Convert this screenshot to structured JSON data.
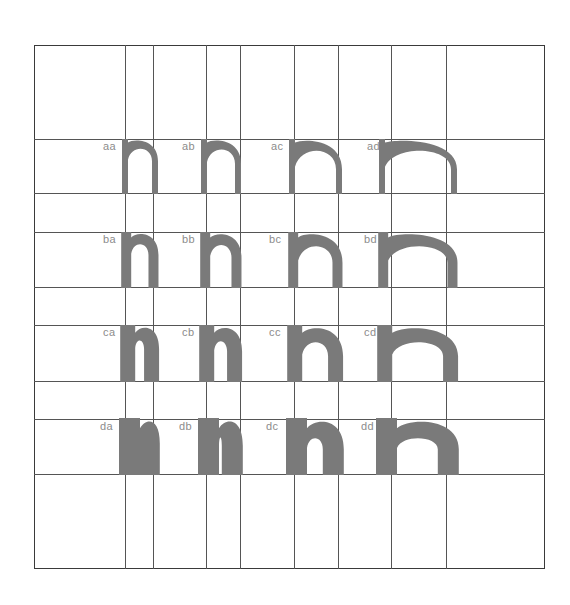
{
  "figure": {
    "title": "",
    "colors": {
      "background": "#ffffff",
      "glyph": "#7a7a7a",
      "label": "#8c8c8c",
      "grid": "#555555",
      "border": "#3a3a3a"
    },
    "frame": {
      "left": 34,
      "top": 45,
      "right": 545,
      "bottom": 569
    },
    "vertical_lines_x": [
      125,
      153,
      206,
      240,
      294,
      338,
      391,
      446
    ],
    "horizontal_lines_y": [
      139,
      193,
      232,
      287,
      325,
      381,
      419,
      474
    ],
    "rows": [
      {
        "id": "a",
        "top": 139,
        "bottom": 194,
        "stem": 6,
        "arch": 6
      },
      {
        "id": "b",
        "top": 232,
        "bottom": 288,
        "stem": 10,
        "arch": 9
      },
      {
        "id": "c",
        "top": 325,
        "bottom": 382,
        "stem": 15,
        "arch": 13
      },
      {
        "id": "d",
        "top": 418,
        "bottom": 475,
        "stem": 21,
        "arch": 17
      }
    ],
    "columns": [
      {
        "id": "a",
        "left": 122,
        "right": 158
      },
      {
        "id": "b",
        "left": 201,
        "right": 241
      },
      {
        "id": "c",
        "left": 289,
        "right": 342
      },
      {
        "id": "d",
        "left": 379,
        "right": 457
      }
    ],
    "cells": [
      {
        "label": "aa",
        "row": 0,
        "col": 0,
        "label_x": 103,
        "label_y": 141
      },
      {
        "label": "ab",
        "row": 0,
        "col": 1,
        "label_x": 182,
        "label_y": 141
      },
      {
        "label": "ac",
        "row": 0,
        "col": 2,
        "label_x": 271,
        "label_y": 141
      },
      {
        "label": "ad",
        "row": 0,
        "col": 3,
        "label_x": 367,
        "label_y": 141
      },
      {
        "label": "ba",
        "row": 1,
        "col": 0,
        "label_x": 103,
        "label_y": 234
      },
      {
        "label": "bb",
        "row": 1,
        "col": 1,
        "label_x": 182,
        "label_y": 234
      },
      {
        "label": "bc",
        "row": 1,
        "col": 2,
        "label_x": 269,
        "label_y": 234
      },
      {
        "label": "bd",
        "row": 1,
        "col": 3,
        "label_x": 364,
        "label_y": 234
      },
      {
        "label": "ca",
        "row": 2,
        "col": 0,
        "label_x": 103,
        "label_y": 327
      },
      {
        "label": "cb",
        "row": 2,
        "col": 1,
        "label_x": 182,
        "label_y": 327
      },
      {
        "label": "cc",
        "row": 2,
        "col": 2,
        "label_x": 269,
        "label_y": 327
      },
      {
        "label": "cd",
        "row": 2,
        "col": 3,
        "label_x": 364,
        "label_y": 327
      },
      {
        "label": "da",
        "row": 3,
        "col": 0,
        "label_x": 100,
        "label_y": 421
      },
      {
        "label": "db",
        "row": 3,
        "col": 1,
        "label_x": 179,
        "label_y": 421
      },
      {
        "label": "dc",
        "row": 3,
        "col": 2,
        "label_x": 266,
        "label_y": 421
      },
      {
        "label": "dd",
        "row": 3,
        "col": 3,
        "label_x": 361,
        "label_y": 421
      }
    ]
  }
}
